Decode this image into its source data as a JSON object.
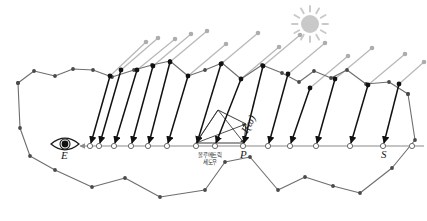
{
  "figure": {
    "background": "#ffffff",
    "width": 427,
    "height": 221
  },
  "colors": {
    "terrain_stroke": "#6e6e6e",
    "terrain_node": "#4a4a4a",
    "shadow_ray": "#111111",
    "light_ray": "#b9b9b9",
    "light_node": "#adadad",
    "view_ray": "#8a8a8a",
    "sample_node_fill": "#ffffff",
    "sample_node_stroke": "#6a6a6a",
    "sun": "#c9c9c9",
    "label_text": "#1a1a1a",
    "korean_text": "#2a2a2a"
  },
  "labels": {
    "eye": "E",
    "point_p": "P",
    "point_s": "S",
    "radiance": "I(ω)",
    "volumetric_shadow_line1": "볼루메트릭",
    "volumetric_shadow_line2": "세도우"
  },
  "icons": {
    "eye": "eye-icon",
    "sun": "sun-icon"
  },
  "chart_data": {
    "type": "diagram",
    "view_ray": {
      "label": "E",
      "y": 146.0,
      "x_start": 86.0,
      "x_end": 424.0,
      "arrow_tip_x": 74.0,
      "samples_x": [
        90,
        99,
        114,
        131,
        148,
        167,
        196,
        215,
        243,
        268,
        290,
        316,
        350,
        383,
        412
      ]
    },
    "eye_icon": {
      "cx": 65,
      "cy": 144,
      "rx": 14,
      "ry": 7.5,
      "pupil_r": 3.4
    },
    "sun_icon": {
      "cx": 310,
      "cy": 24,
      "r": 9,
      "rays": 12
    },
    "upper_terrain": [
      [
        18,
        83
      ],
      [
        34,
        71
      ],
      [
        55,
        76
      ],
      [
        73,
        69
      ],
      [
        93,
        70
      ],
      [
        112,
        77
      ],
      [
        134,
        70
      ],
      [
        152,
        65
      ],
      [
        170,
        61
      ],
      [
        188,
        76
      ],
      [
        205,
        70
      ],
      [
        222,
        63
      ],
      [
        241,
        79
      ],
      [
        262,
        65
      ],
      [
        282,
        73
      ],
      [
        299,
        82
      ],
      [
        314,
        71
      ],
      [
        331,
        78
      ],
      [
        347,
        70
      ],
      [
        366,
        84
      ],
      [
        389,
        82
      ],
      [
        408,
        94
      ]
    ],
    "lower_terrain": [
      [
        18,
        83
      ],
      [
        20,
        128
      ],
      [
        30,
        156
      ],
      [
        55,
        170
      ],
      [
        92,
        187
      ],
      [
        125,
        178
      ],
      [
        160,
        197
      ],
      [
        205,
        190
      ],
      [
        225,
        162
      ],
      [
        250,
        157
      ],
      [
        278,
        190
      ],
      [
        305,
        177
      ],
      [
        333,
        186
      ],
      [
        360,
        193
      ],
      [
        392,
        168
      ],
      [
        415,
        140
      ],
      [
        408,
        94
      ]
    ],
    "shadow_rays": [
      {
        "from": [
          110,
          76
        ],
        "to": [
          91,
          143
        ]
      },
      {
        "from": [
          121,
          70
        ],
        "to": [
          100,
          143
        ]
      },
      {
        "from": [
          137,
          70
        ],
        "to": [
          115,
          143
        ]
      },
      {
        "from": [
          153,
          66
        ],
        "to": [
          132,
          143
        ]
      },
      {
        "from": [
          170,
          62
        ],
        "to": [
          149,
          143
        ]
      },
      {
        "from": [
          188,
          76
        ],
        "to": [
          168,
          143
        ]
      },
      {
        "from": [
          221,
          64
        ],
        "to": [
          197,
          143
        ]
      },
      {
        "from": [
          241,
          79
        ],
        "to": [
          216,
          143
        ]
      },
      {
        "from": [
          263,
          66
        ],
        "to": [
          244,
          143
        ]
      },
      {
        "from": [
          288,
          74
        ],
        "to": [
          269,
          143
        ]
      },
      {
        "from": [
          310,
          88
        ],
        "to": [
          291,
          143
        ]
      },
      {
        "from": [
          335,
          79
        ],
        "to": [
          317,
          143
        ]
      },
      {
        "from": [
          368,
          85
        ],
        "to": [
          351,
          143
        ]
      },
      {
        "from": [
          399,
          84
        ],
        "to": [
          384,
          143
        ]
      }
    ],
    "light_rays": [
      {
        "from": [
          110,
          76
        ],
        "to": [
          146,
          42
        ]
      },
      {
        "from": [
          121,
          70
        ],
        "to": [
          158,
          38
        ]
      },
      {
        "from": [
          137,
          70
        ],
        "to": [
          175,
          39
        ]
      },
      {
        "from": [
          153,
          66
        ],
        "to": [
          191,
          34
        ]
      },
      {
        "from": [
          170,
          62
        ],
        "to": [
          207,
          31
        ]
      },
      {
        "from": [
          188,
          76
        ],
        "to": [
          226,
          44
        ]
      },
      {
        "from": [
          221,
          64
        ],
        "to": [
          258,
          33
        ]
      },
      {
        "from": [
          241,
          79
        ],
        "to": [
          279,
          47
        ]
      },
      {
        "from": [
          263,
          66
        ],
        "to": [
          300,
          35
        ]
      },
      {
        "from": [
          288,
          74
        ],
        "to": [
          325,
          43
        ]
      },
      {
        "from": [
          310,
          88
        ],
        "to": [
          348,
          56
        ]
      },
      {
        "from": [
          335,
          79
        ],
        "to": [
          372,
          48
        ]
      },
      {
        "from": [
          368,
          85
        ],
        "to": [
          405,
          54
        ]
      },
      {
        "from": [
          399,
          84
        ],
        "to": [
          424,
          62
        ]
      }
    ],
    "volumetric_shadow_polygon": [
      [
        196,
        143
      ],
      [
        218,
        110
      ],
      [
        246,
        124
      ],
      [
        244,
        143
      ]
    ],
    "volumetric_shadow_inner": [
      [
        196,
        143
      ],
      [
        246,
        124
      ],
      [
        218,
        110
      ],
      [
        244,
        143
      ]
    ]
  }
}
